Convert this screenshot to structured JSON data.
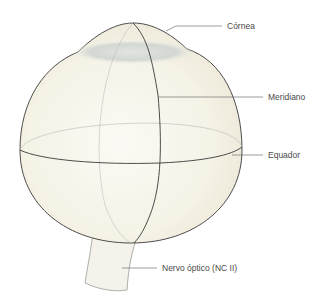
{
  "figure": {
    "colors": {
      "globe_fill": "#f6f3e8",
      "outline": "#3a3a3a",
      "back_line": "#b8b8b8",
      "cornea_shade": "#c9cfcc",
      "leader": "#5a5a5a",
      "text": "#4a4a4a"
    }
  },
  "labels": {
    "cornea": "Córnea",
    "meridian": "Meridiano",
    "equator": "Equador",
    "optic_nerve": "Nervo óptico (NC II)"
  }
}
